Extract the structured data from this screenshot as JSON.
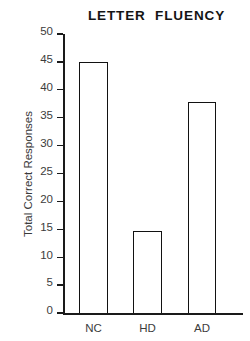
{
  "chart_data": {
    "type": "bar",
    "title": "LETTER  FLUENCY",
    "xlabel": "",
    "ylabel": "Total Correct Responses",
    "categories": [
      "NC",
      "HD",
      "AD"
    ],
    "values": [
      45,
      14.7,
      37.8
    ],
    "ylim": [
      0,
      50
    ],
    "ytick_labels": [
      "50",
      "45",
      "40",
      "35",
      "30",
      "25",
      "20",
      "15",
      "10",
      "5",
      "0"
    ],
    "ytick_values": [
      50,
      45,
      40,
      35,
      30,
      25,
      20,
      15,
      10,
      5,
      0
    ],
    "grid": false,
    "legend": null,
    "series": [
      {
        "name": "Total Correct Responses",
        "values": [
          45,
          14.7,
          37.8
        ]
      }
    ],
    "colors": {
      "bar_fill": "#ffffff",
      "bar_edge": "#121212",
      "axis": "#1a1a1a",
      "text": "#3c3c3c",
      "title": "#141414",
      "background": "#ffffff"
    }
  }
}
